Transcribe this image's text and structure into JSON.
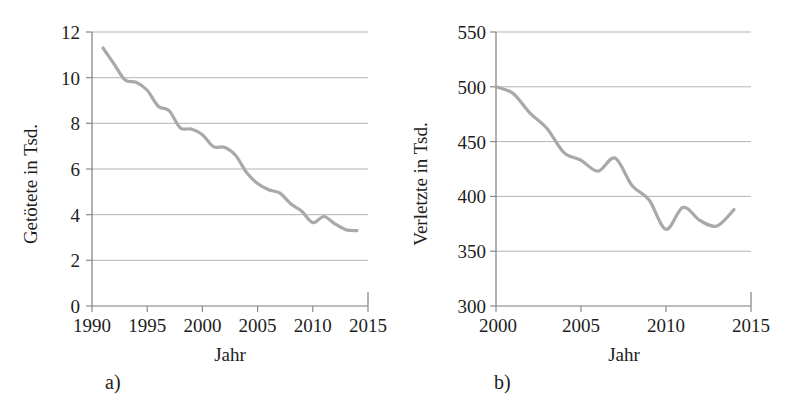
{
  "figure": {
    "panel_a_letter": "a)",
    "panel_b_letter": "b)"
  },
  "chart_data": [
    {
      "id": "a",
      "type": "line",
      "title": "",
      "xlabel": "Jahr",
      "ylabel": "Getötete in Tsd.",
      "xlim": [
        1990,
        2015
      ],
      "ylim": [
        0,
        12
      ],
      "xticks": [
        1990,
        1995,
        2000,
        2005,
        2010,
        2015
      ],
      "xticklabels": [
        "1990",
        "1995",
        "2000",
        "2005",
        "2010",
        "2015"
      ],
      "yticks": [
        0,
        2,
        4,
        6,
        8,
        10,
        12
      ],
      "yticklabels": [
        "0",
        "2",
        "4",
        "6",
        "8",
        "10",
        "12"
      ],
      "grid": "horizontal",
      "legend": "none",
      "line_color": "#a9a9a9",
      "line_width": 3.2,
      "x": [
        1991,
        1992,
        1993,
        1994,
        1995,
        1996,
        1997,
        1998,
        1999,
        2000,
        2001,
        2002,
        2003,
        2004,
        2005,
        2006,
        2007,
        2008,
        2009,
        2010,
        2011,
        2012,
        2013,
        2014
      ],
      "y": [
        11.3,
        10.6,
        9.9,
        9.8,
        9.45,
        8.75,
        8.55,
        7.8,
        7.75,
        7.5,
        6.98,
        6.95,
        6.6,
        5.85,
        5.36,
        5.09,
        4.95,
        4.48,
        4.15,
        3.65,
        3.92,
        3.6,
        3.34,
        3.3
      ],
      "annotations": []
    },
    {
      "id": "b",
      "type": "line",
      "title": "",
      "xlabel": "Jahr",
      "ylabel": "Verletzte in Tsd.",
      "xlim": [
        2000,
        2015
      ],
      "ylim": [
        300,
        550
      ],
      "xticks": [
        2000,
        2005,
        2010,
        2015
      ],
      "xticklabels": [
        "2000",
        "2005",
        "2010",
        "2015"
      ],
      "yticks": [
        300,
        350,
        400,
        450,
        500,
        550
      ],
      "yticklabels": [
        "300",
        "350",
        "400",
        "450",
        "500",
        "550"
      ],
      "grid": "horizontal",
      "legend": "none",
      "line_color": "#a9a9a9",
      "line_width": 3.2,
      "x": [
        2000,
        2001,
        2002,
        2003,
        2004,
        2005,
        2006,
        2007,
        2008,
        2009,
        2010,
        2011,
        2012,
        2013,
        2014
      ],
      "y": [
        500,
        494,
        476,
        462,
        440,
        433,
        423,
        435,
        410,
        397,
        370,
        390,
        378,
        373,
        388
      ],
      "annotations": []
    }
  ]
}
